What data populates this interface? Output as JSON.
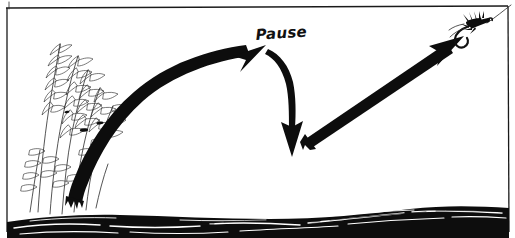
{
  "illustration": {
    "title": "Fly cast trajectory with pause",
    "style": "hand-drawn pen and ink line art",
    "background_color": "#ffffff",
    "ink_color": "#111111",
    "width": 515,
    "height": 238
  },
  "frame": {
    "name": "border-frame",
    "visible": true,
    "color": "#1a1a1a"
  },
  "annotations": {
    "pause_label": "Pause"
  },
  "elements": {
    "vegetation_label": "streamside grass",
    "water_label": "water surface",
    "fly_label": "fly and hook",
    "leader_label": "leader line"
  },
  "arrows": [
    {
      "name": "forward-cast-arrow",
      "label": "forward cast rising stroke",
      "style": "thick tapered curve",
      "direction": "up-right",
      "from": [
        72,
        196
      ],
      "to": [
        264,
        47
      ]
    },
    {
      "name": "pause-drop-arrow",
      "label": "pause drop curve",
      "style": "thin curve",
      "direction": "down",
      "from": [
        268,
        50
      ],
      "to": [
        296,
        150
      ]
    },
    {
      "name": "retrieve-arrow",
      "label": "retrieve lift stroke",
      "style": "thick straight",
      "direction": "up-right",
      "from": [
        308,
        133
      ],
      "to": [
        463,
        46
      ]
    }
  ]
}
